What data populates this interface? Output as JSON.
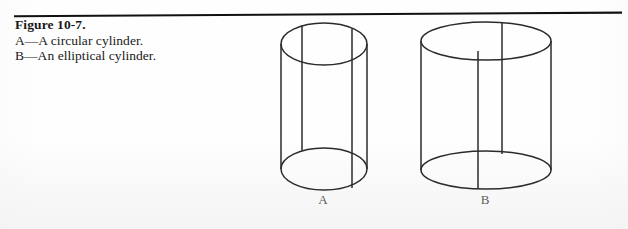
{
  "page": {
    "background_color": "#fefefe",
    "ink_color": "#1a1a1a"
  },
  "divider": {
    "name": "horizontal-rule",
    "color": "#111111"
  },
  "caption": {
    "title": "Figure 10-7.",
    "lines": [
      "A—A circular cylinder.",
      "B—An elliptical cylinder."
    ]
  },
  "figures": [
    {
      "id": "A",
      "label": "A",
      "kind": "circular-cylinder",
      "description": "A circular cylinder.",
      "geometry": {
        "left_edge_x": 281,
        "right_edge_x": 367,
        "top_ellipse_center": [
          324,
          44
        ],
        "bottom_ellipse_center": [
          324,
          169
        ],
        "ellipse_rx": 43,
        "ellipse_ry": 21,
        "element_lines_x": [
          302,
          352
        ]
      }
    },
    {
      "id": "B",
      "label": "B",
      "kind": "elliptical-cylinder",
      "description": "An elliptical cylinder.",
      "geometry": {
        "left_edge_x": 421,
        "right_edge_x": 552,
        "top_ellipse_center": [
          486,
          41
        ],
        "bottom_ellipse_center": [
          486,
          170
        ],
        "ellipse_rx": 65,
        "ellipse_ry": 19,
        "element_lines_x": [
          478,
          502
        ]
      }
    }
  ]
}
